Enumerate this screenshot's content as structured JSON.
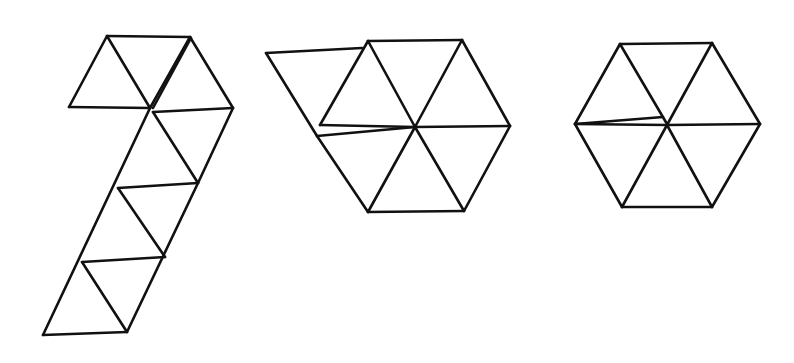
{
  "diagram": {
    "stroke_color": "#111111",
    "background": "#ffffff",
    "figures": [
      {
        "id": "figure-1",
        "name": "strip-with-top-flap",
        "triangle_count": 10,
        "segments": [
          [
            107,
            36,
            190,
            37
          ],
          [
            107,
            36,
            69,
            107
          ],
          [
            69,
            107,
            150,
            108
          ],
          [
            107,
            36,
            150,
            108
          ],
          [
            150,
            108,
            190,
            37
          ],
          [
            153,
            108,
            191,
            38
          ],
          [
            190,
            37,
            233,
            108
          ],
          [
            153,
            112,
            233,
            108
          ],
          [
            233,
            108,
            198,
            183
          ],
          [
            153,
            112,
            198,
            183
          ],
          [
            150,
            108,
            43,
            335
          ],
          [
            118,
            188,
            198,
            183
          ],
          [
            118,
            188,
            165,
            257
          ],
          [
            198,
            183,
            127,
            332
          ],
          [
            82,
            262,
            165,
            257
          ],
          [
            82,
            262,
            127,
            332
          ],
          [
            43,
            335,
            127,
            332
          ]
        ]
      },
      {
        "id": "figure-2",
        "name": "hexagon-with-extra-triangle",
        "triangle_count": 7,
        "segments": [
          [
            266,
            53,
            362,
            48
          ],
          [
            266,
            53,
            317,
            136
          ],
          [
            368,
            41,
            462,
            40
          ],
          [
            368,
            41,
            320,
            125
          ],
          [
            462,
            40,
            510,
            126
          ],
          [
            368,
            41,
            415,
            127
          ],
          [
            462,
            40,
            415,
            127
          ],
          [
            320,
            125,
            415,
            127
          ],
          [
            317,
            136,
            415,
            127
          ],
          [
            415,
            127,
            510,
            126
          ],
          [
            317,
            136,
            368,
            212
          ],
          [
            415,
            127,
            368,
            212
          ],
          [
            415,
            127,
            464,
            211
          ],
          [
            510,
            126,
            464,
            211
          ],
          [
            368,
            212,
            464,
            211
          ]
        ]
      },
      {
        "id": "figure-3",
        "name": "hexagon",
        "triangle_count": 6,
        "segments": [
          [
            620,
            44,
            712,
            43
          ],
          [
            620,
            44,
            575,
            124
          ],
          [
            712,
            43,
            760,
            124
          ],
          [
            620,
            44,
            667,
            124
          ],
          [
            712,
            43,
            667,
            125
          ],
          [
            575,
            124,
            667,
            125
          ],
          [
            575,
            124,
            663,
            117
          ],
          [
            667,
            125,
            760,
            124
          ],
          [
            575,
            124,
            622,
            207
          ],
          [
            667,
            125,
            622,
            207
          ],
          [
            667,
            125,
            712,
            207
          ],
          [
            760,
            124,
            712,
            207
          ],
          [
            622,
            207,
            712,
            207
          ]
        ]
      }
    ]
  }
}
